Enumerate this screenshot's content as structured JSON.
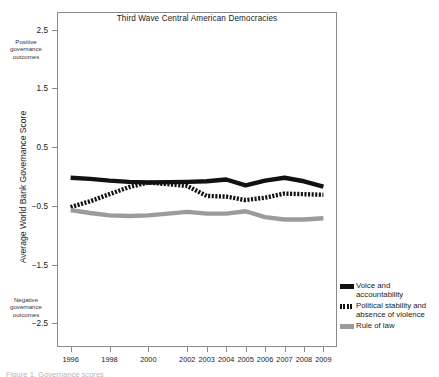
{
  "chart_data": {
    "type": "line",
    "title": "Third Wave Central American Democracies",
    "xlabel": "",
    "ylabel": "Average World Bank Governance Score",
    "x": [
      1996,
      1997,
      1998,
      1999,
      2000,
      2002,
      2003,
      2004,
      2005,
      2006,
      2007,
      2008,
      2009
    ],
    "xtick_labels": [
      "1996",
      "1998",
      "2000",
      "2002",
      "2003",
      "2004",
      "2005",
      "2006",
      "2007",
      "2008",
      "2009"
    ],
    "xtick_values": [
      1996,
      1998,
      2000,
      2002,
      2003,
      2004,
      2005,
      2006,
      2007,
      2008,
      2009
    ],
    "ytick_labels": [
      "2.5",
      "1.5",
      "0.5",
      "-0.5",
      "-1.5",
      "-2.5"
    ],
    "ytick_values": [
      2.5,
      1.5,
      0.5,
      -0.5,
      -1.5,
      -2.5
    ],
    "ylim": [
      -2.9,
      2.8
    ],
    "xlim": [
      1995.3,
      2009.7
    ],
    "grid": false,
    "legend_position": "right",
    "annotations": [
      {
        "name": "positive-pole",
        "text": "Positive governance outcomes",
        "value": 2.0
      },
      {
        "name": "negative-pole",
        "text": "Negative governance outcomes",
        "value": -2.2
      }
    ],
    "series": [
      {
        "name": "Voice and accountability",
        "style": "solid",
        "color": "#111111",
        "values": [
          -0.02,
          -0.04,
          -0.07,
          -0.09,
          -0.1,
          -0.09,
          -0.08,
          -0.05,
          -0.15,
          -0.07,
          -0.02,
          -0.08,
          -0.17
        ]
      },
      {
        "name": "Political stability and absence of violence",
        "style": "dashed",
        "color": "#111111",
        "values": [
          -0.52,
          -0.42,
          -0.3,
          -0.18,
          -0.1,
          -0.16,
          -0.33,
          -0.34,
          -0.4,
          -0.36,
          -0.29,
          -0.3,
          -0.31
        ]
      },
      {
        "name": "Rule of law",
        "style": "solid",
        "color": "#9b9b9b",
        "values": [
          -0.57,
          -0.62,
          -0.66,
          -0.67,
          -0.66,
          -0.6,
          -0.63,
          -0.63,
          -0.59,
          -0.69,
          -0.73,
          -0.73,
          -0.71
        ]
      }
    ]
  },
  "legend": {
    "items": [
      {
        "label": "Voice and accountability",
        "swatch": "solid-black"
      },
      {
        "label": "Political stability and absence of violence",
        "swatch": "dashed"
      },
      {
        "label": "Rule of law",
        "swatch": "solid-gray"
      }
    ]
  },
  "axis": {
    "y_title": "Average World Bank Governance Score",
    "positive_note": "Positive governance outcomes",
    "negative_note": "Negative governance outcomes"
  },
  "footer": {
    "caption": "Figure 1. Governance scores"
  }
}
